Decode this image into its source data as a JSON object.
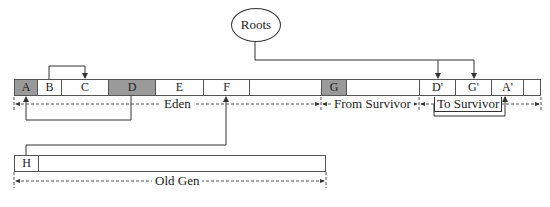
{
  "roots": {
    "label": "Roots"
  },
  "young_cells": [
    {
      "label": "A",
      "shaded": true
    },
    {
      "label": "B",
      "shaded": false
    },
    {
      "label": "C",
      "shaded": false
    },
    {
      "label": "D",
      "shaded": true
    },
    {
      "label": "E",
      "shaded": false
    },
    {
      "label": "F",
      "shaded": false
    },
    {
      "label": "",
      "shaded": false
    },
    {
      "label": "G",
      "shaded": true
    },
    {
      "label": "",
      "shaded": false
    },
    {
      "label": "D'",
      "shaded": false
    },
    {
      "label": "G'",
      "shaded": false
    },
    {
      "label": "A'",
      "shaded": false
    },
    {
      "label": "",
      "shaded": false
    }
  ],
  "regions": {
    "eden": "Eden",
    "from_survivor": "From Survivor",
    "to_survivor": "To Survivor",
    "old_gen": "Old Gen"
  },
  "old_cells": [
    {
      "label": "H"
    }
  ],
  "references": [
    {
      "from": "B",
      "to": "C"
    },
    {
      "from": "D",
      "to": "A"
    },
    {
      "from": "H",
      "to": "F"
    },
    {
      "from": "Roots",
      "to": "D'"
    },
    {
      "from": "Roots",
      "to": "G'"
    },
    {
      "from": "To Survivor",
      "to": "A'"
    }
  ]
}
